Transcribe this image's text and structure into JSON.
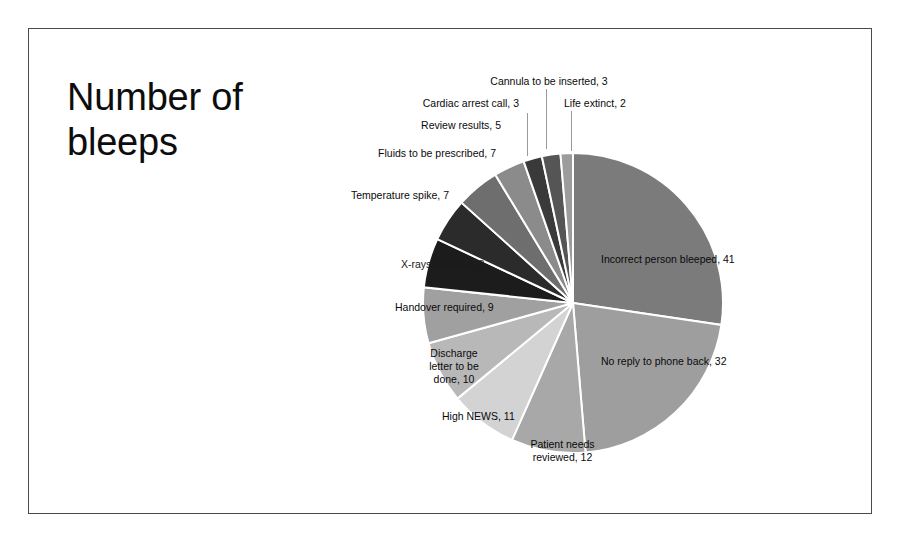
{
  "slide": {
    "title": "Number of\nbleeps",
    "background_color": "#ffffff",
    "border_color": "#4a4a4a"
  },
  "chart_data": {
    "type": "pie",
    "title": "Number of bleeps",
    "xlabel": "",
    "ylabel": "",
    "total": 150,
    "start_angle_deg": 0,
    "direction": "clockwise",
    "legend": "none",
    "data_labels": "category name and value, outside/inside end",
    "categories": [
      "Incorrect person bleeped",
      "No reply to phone back",
      "Patient needs reviewed",
      "High NEWS",
      "Discharge letter to be done",
      "Handover required",
      "X-rays required",
      "Temperature spike",
      "Fluids to be prescribed",
      "Review results",
      "Cardiac arrest call",
      "Cannula to be inserted",
      "Life extinct"
    ],
    "values": [
      41,
      32,
      12,
      11,
      10,
      9,
      8,
      7,
      7,
      5,
      3,
      3,
      2
    ],
    "colors": [
      "#7b7b7b",
      "#9e9e9e",
      "#a8a8a8",
      "#d3d3d3",
      "#b8b8b8",
      "#a0a0a0",
      "#1c1c1c",
      "#2b2b2b",
      "#6e6e6e",
      "#8b8b8b",
      "#3a3a3a",
      "#555555",
      "#9c9c9c"
    ],
    "labels": [
      {
        "text": "Incorrect person bleeped, 41",
        "value": 41,
        "category": "Incorrect person bleeped"
      },
      {
        "text": "No reply to phone back, 32",
        "value": 32,
        "category": "No reply to phone back"
      },
      {
        "text": "Patient needs\nreviewed, 12",
        "value": 12,
        "category": "Patient needs reviewed"
      },
      {
        "text": "High NEWS, 11",
        "value": 11,
        "category": "High NEWS"
      },
      {
        "text": "Discharge\nletter to be\ndone, 10",
        "value": 10,
        "category": "Discharge letter to be done"
      },
      {
        "text": "Handover required, 9",
        "value": 9,
        "category": "Handover required"
      },
      {
        "text": "X-rays required, 8",
        "value": 8,
        "category": "X-rays required"
      },
      {
        "text": "Temperature spike, 7",
        "value": 7,
        "category": "Temperature spike"
      },
      {
        "text": "Fluids to be prescribed, 7",
        "value": 7,
        "category": "Fluids to be prescribed"
      },
      {
        "text": "Review results, 5",
        "value": 5,
        "category": "Review results"
      },
      {
        "text": "Cardiac arrest call, 3",
        "value": 3,
        "category": "Cardiac arrest call"
      },
      {
        "text": "Cannula to be inserted, 3",
        "value": 3,
        "category": "Cannula to be inserted"
      },
      {
        "text": "Life extinct, 2",
        "value": 2,
        "category": "Life extinct"
      }
    ]
  }
}
